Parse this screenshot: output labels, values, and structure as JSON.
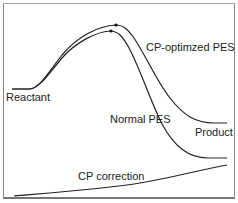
{
  "diagram": {
    "labels": {
      "cp_optimized": "CP-optimzed PES",
      "reactant": "Reactant",
      "normal": "Normal PES",
      "product": "Product",
      "cp_correction": "CP correction"
    },
    "colors": {
      "curve": "#222222",
      "frame": "#888888",
      "text": "#222222"
    }
  }
}
